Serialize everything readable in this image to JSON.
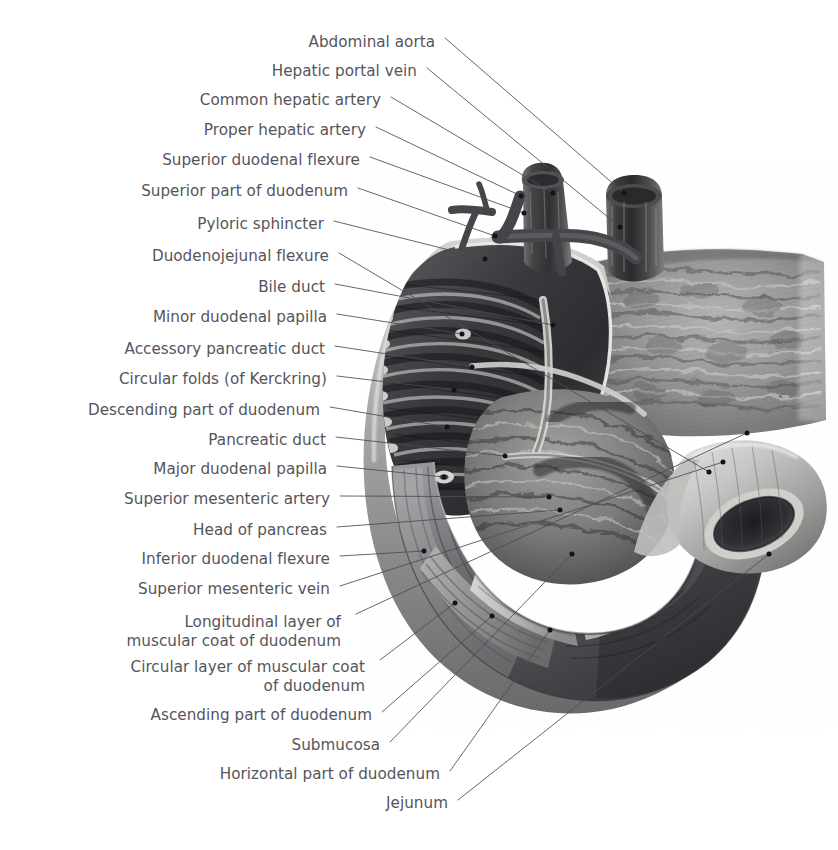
{
  "plate": {
    "title": "Duodenum and pancreas, anterior view with mucosa exposed",
    "background_color": "#ffffff",
    "label_color": "#55555b",
    "leader_color": "#4b4b50",
    "dot_color": "#141418",
    "width": 838,
    "height": 850
  },
  "labels": [
    {
      "id": "abdominal-aorta",
      "text": "Abdominal aorta",
      "x": 435,
      "y": 43,
      "align": "right"
    },
    {
      "id": "hepatic-portal-vein",
      "text": "Hepatic portal vein",
      "x": 417,
      "y": 72,
      "align": "right"
    },
    {
      "id": "common-hepatic-artery",
      "text": "Common hepatic artery",
      "x": 381,
      "y": 101,
      "align": "right"
    },
    {
      "id": "proper-hepatic-artery",
      "text": "Proper hepatic artery",
      "x": 366,
      "y": 131,
      "align": "right"
    },
    {
      "id": "superior-duodenal-flexure",
      "text": "Superior duodenal flexure",
      "x": 360,
      "y": 161,
      "align": "right"
    },
    {
      "id": "superior-part-of-duodenum",
      "text": "Superior part of duodenum",
      "x": 348,
      "y": 192,
      "align": "right"
    },
    {
      "id": "pyloric-sphincter",
      "text": "Pyloric sphincter",
      "x": 324,
      "y": 225,
      "align": "right"
    },
    {
      "id": "duodenojejunal-flexure",
      "text": "Duodenojejunal flexure",
      "x": 329,
      "y": 257,
      "align": "right"
    },
    {
      "id": "bile-duct",
      "text": "Bile duct",
      "x": 325,
      "y": 288,
      "align": "right"
    },
    {
      "id": "minor-duodenal-papilla",
      "text": "Minor duodenal papilla",
      "x": 327,
      "y": 318,
      "align": "right"
    },
    {
      "id": "accessory-pancreatic-duct",
      "text": "Accessory pancreatic duct",
      "x": 325,
      "y": 350,
      "align": "right"
    },
    {
      "id": "circular-folds",
      "text": "Circular folds (of Kerckring)",
      "x": 327,
      "y": 380,
      "align": "right"
    },
    {
      "id": "descending-part-of-duodenum",
      "text": "Descending part of duodenum",
      "x": 320,
      "y": 411,
      "align": "right"
    },
    {
      "id": "pancreatic-duct",
      "text": "Pancreatic duct",
      "x": 326,
      "y": 441,
      "align": "right"
    },
    {
      "id": "major-duodenal-papilla",
      "text": "Major duodenal papilla",
      "x": 327,
      "y": 470,
      "align": "right"
    },
    {
      "id": "superior-mesenteric-artery",
      "text": "Superior mesenteric artery",
      "x": 330,
      "y": 500,
      "align": "right"
    },
    {
      "id": "head-of-pancreas",
      "text": "Head of pancreas",
      "x": 327,
      "y": 531,
      "align": "right"
    },
    {
      "id": "inferior-duodenal-flexure",
      "text": "Inferior duodenal flexure",
      "x": 330,
      "y": 560,
      "align": "right"
    },
    {
      "id": "superior-mesenteric-vein",
      "text": "Superior mesenteric vein",
      "x": 330,
      "y": 590,
      "align": "right"
    },
    {
      "id": "longitudinal-layer",
      "text": "Longitudinal layer of\nmuscular coat of duodenum",
      "x": 341,
      "y": 632,
      "align": "right",
      "lines": 2
    },
    {
      "id": "circular-layer",
      "text": "Circular layer of muscular coat\nof duodenum",
      "x": 365,
      "y": 677,
      "align": "right",
      "lines": 2
    },
    {
      "id": "ascending-part-of-duodenum",
      "text": "Ascending part of duodenum",
      "x": 372,
      "y": 716,
      "align": "right"
    },
    {
      "id": "submucosa",
      "text": "Submucosa",
      "x": 380,
      "y": 746,
      "align": "right"
    },
    {
      "id": "horizontal-part-of-duodenum",
      "text": "Horizontal part of duodenum",
      "x": 440,
      "y": 775,
      "align": "right"
    },
    {
      "id": "jejunum",
      "text": "Jejunum",
      "x": 448,
      "y": 804,
      "align": "right"
    }
  ],
  "leaders": [
    {
      "id": "abdominal-aorta",
      "x1": 445,
      "y1": 38,
      "x2": 624,
      "y2": 193
    },
    {
      "id": "hepatic-portal-vein",
      "x1": 427,
      "y1": 68,
      "x2": 620,
      "y2": 227
    },
    {
      "id": "common-hepatic-artery",
      "x1": 391,
      "y1": 97,
      "x2": 553,
      "y2": 193
    },
    {
      "id": "proper-hepatic-artery",
      "x1": 376,
      "y1": 127,
      "x2": 521,
      "y2": 196
    },
    {
      "id": "superior-duodenal-flexure",
      "x1": 370,
      "y1": 157,
      "x2": 524,
      "y2": 213
    },
    {
      "id": "superior-part-of-duodenum",
      "x1": 358,
      "y1": 188,
      "x2": 495,
      "y2": 236
    },
    {
      "id": "pyloric-sphincter",
      "x1": 334,
      "y1": 221,
      "x2": 485,
      "y2": 259
    },
    {
      "id": "duodenojejunal-flexure",
      "x1": 339,
      "y1": 253,
      "x2": 709,
      "y2": 472
    },
    {
      "id": "bile-duct",
      "x1": 335,
      "y1": 284,
      "x2": 553,
      "y2": 325
    },
    {
      "id": "minor-duodenal-papilla",
      "x1": 337,
      "y1": 314,
      "x2": 462,
      "y2": 334
    },
    {
      "id": "accessory-pancreatic-duct",
      "x1": 335,
      "y1": 346,
      "x2": 472,
      "y2": 367
    },
    {
      "id": "circular-folds",
      "x1": 337,
      "y1": 376,
      "x2": 454,
      "y2": 390
    },
    {
      "id": "descending-part-of-duodenum",
      "x1": 330,
      "y1": 407,
      "x2": 447,
      "y2": 427
    },
    {
      "id": "pancreatic-duct",
      "x1": 336,
      "y1": 437,
      "x2": 505,
      "y2": 456
    },
    {
      "id": "major-duodenal-papilla",
      "x1": 337,
      "y1": 466,
      "x2": 444,
      "y2": 477
    },
    {
      "id": "superior-mesenteric-artery",
      "x1": 340,
      "y1": 496,
      "x2": 549,
      "y2": 497
    },
    {
      "id": "head-of-pancreas",
      "x1": 337,
      "y1": 527,
      "x2": 560,
      "y2": 510
    },
    {
      "id": "inferior-duodenal-flexure",
      "x1": 340,
      "y1": 556,
      "x2": 424,
      "y2": 551
    },
    {
      "id": "superior-mesenteric-vein",
      "x1": 340,
      "y1": 586,
      "x2": 723,
      "y2": 462
    },
    {
      "id": "longitudinal-layer",
      "x1": 356,
      "y1": 614,
      "x2": 747,
      "y2": 433
    },
    {
      "id": "circular-layer",
      "x1": 380,
      "y1": 660,
      "x2": 455,
      "y2": 603
    },
    {
      "id": "ascending-part-of-duodenum",
      "x1": 382,
      "y1": 712,
      "x2": 492,
      "y2": 616
    },
    {
      "id": "submucosa",
      "x1": 390,
      "y1": 742,
      "x2": 572,
      "y2": 554
    },
    {
      "id": "horizontal-part-of-duodenum",
      "x1": 450,
      "y1": 771,
      "x2": 550,
      "y2": 630
    },
    {
      "id": "jejunum",
      "x1": 458,
      "y1": 800,
      "x2": 769,
      "y2": 554
    }
  ],
  "structures": [
    {
      "id": "abdominal-aorta",
      "name": "Abdominal aorta",
      "kind": "vessel-trunk"
    },
    {
      "id": "hepatic-portal-vein",
      "name": "Hepatic portal vein",
      "kind": "vessel-trunk"
    },
    {
      "id": "hepatic-arteries",
      "name": "Hepatic arteries",
      "kind": "vessel-branch"
    },
    {
      "id": "duodenum-c-loop",
      "name": "Duodenum (C-loop)",
      "kind": "organ"
    },
    {
      "id": "duodenal-mucosa",
      "name": "Duodenal mucosa with circular folds",
      "kind": "mucosa"
    },
    {
      "id": "pancreas-body",
      "name": "Pancreas (body and tail)",
      "kind": "gland"
    },
    {
      "id": "pancreas-head",
      "name": "Head of pancreas",
      "kind": "gland"
    },
    {
      "id": "jejunum-cut-end",
      "name": "Jejunum, cut end",
      "kind": "organ"
    },
    {
      "id": "muscular-coat-window",
      "name": "Muscular coat dissection windows",
      "kind": "dissection"
    }
  ]
}
